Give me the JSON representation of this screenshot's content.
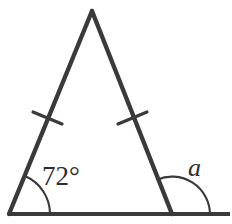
{
  "figure": {
    "kind": "isosceles-triangle-diagram",
    "background_color": "#ffffff",
    "stroke_color": "#3a3a3a",
    "text_color": "#2e2e2e",
    "labels": {
      "base_angle": "72°",
      "exterior_angle": "a"
    },
    "vertices": {
      "apex": {
        "x": 92,
        "y": 10
      },
      "bottom_left": {
        "x": 9,
        "y": 214
      },
      "bottom_right": {
        "x": 172,
        "y": 214
      }
    },
    "base_ray_end": {
      "x": 230,
      "y": 214
    },
    "tick_marks": [
      {
        "name": "left-leg-tick",
        "x": 47,
        "y": 118
      },
      {
        "name": "right-leg-tick",
        "x": 132,
        "y": 118
      }
    ],
    "arcs": [
      {
        "name": "base-angle-arc",
        "center_x": 9,
        "center_y": 214,
        "radius": 41
      },
      {
        "name": "exterior-angle-arc",
        "center_x": 172,
        "center_y": 214,
        "radius": 38
      }
    ],
    "label_positions": {
      "base_angle": {
        "x": 42,
        "y": 185
      },
      "exterior_angle": {
        "x": 188,
        "y": 176
      }
    }
  }
}
